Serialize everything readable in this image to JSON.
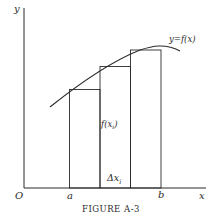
{
  "figure": {
    "caption": "Figure A-3",
    "caption_display": "FIGURE A-3",
    "axis_labels": {
      "y": "y",
      "x": "x",
      "origin": "O"
    },
    "tick_labels": {
      "a": "a",
      "b": "b"
    },
    "curve_label": "y=f(x)",
    "rect_height_label": "f(x_i)",
    "rect_width_label": "Δx_i",
    "rect_height_label_main": "f(x",
    "rect_height_label_sub": "i",
    "rect_height_label_close": ")",
    "rect_width_label_main": "Δx",
    "rect_width_label_sub": "i",
    "colors": {
      "ink": "#2a2a2a",
      "background": "#ffffff"
    },
    "rectangles": [
      {
        "index": 1,
        "x_left": "a",
        "description": "left-endpoint rectangle"
      },
      {
        "index": 2,
        "description": "middle rectangle, labeled f(x_i) and Δx_i"
      },
      {
        "index": 3,
        "x_right": "b",
        "description": "right rectangle"
      }
    ]
  }
}
